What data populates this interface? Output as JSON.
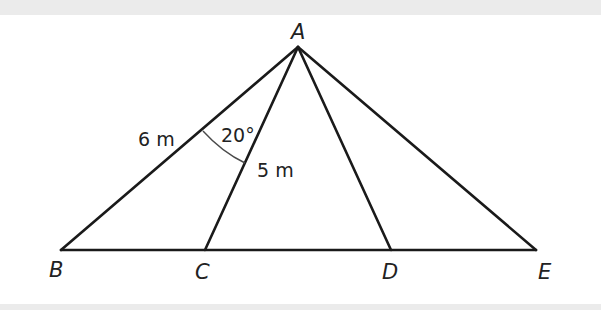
{
  "diagram": {
    "type": "geometry-triangle",
    "vertices": {
      "A": {
        "label": "A",
        "x": 298,
        "y": 47
      },
      "B": {
        "label": "B",
        "x": 61,
        "y": 250
      },
      "C": {
        "label": "C",
        "x": 205,
        "y": 250
      },
      "D": {
        "label": "D",
        "x": 391,
        "y": 250
      },
      "E": {
        "label": "E",
        "x": 536,
        "y": 250
      }
    },
    "segments": [
      "AB",
      "AC",
      "AD",
      "AE",
      "BE"
    ],
    "measurements": {
      "AB": "6 m",
      "AC": "5 m",
      "angle_BAC": "20°"
    },
    "colors": {
      "line": "#1a1a1a",
      "arc": "#4a4a4a",
      "text": "#222222",
      "band": "#ebebeb",
      "background": "#ffffff"
    }
  }
}
